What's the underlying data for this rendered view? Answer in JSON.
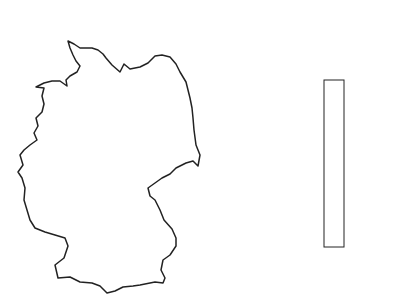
{
  "colors": {
    "outline": "#222222",
    "bands": [
      "#555555",
      "#5e5e5e",
      "#6a6a6a",
      "#7c7c7c",
      "#929292",
      "#b2b2b2",
      "#d2d2d2",
      "#ffffff"
    ]
  },
  "legend": {
    "ticks": [
      {
        "label": "15",
        "y": 200
      },
      {
        "label": "20",
        "y": 155
      },
      {
        "label": "25",
        "y": 108
      }
    ]
  },
  "points": [
    {
      "x": 59,
      "y": 67,
      "c": "#8a8a8a"
    },
    {
      "x": 97,
      "y": 70,
      "c": "#aaaaaa"
    },
    {
      "x": 106,
      "y": 69,
      "c": "#666666"
    },
    {
      "x": 93,
      "y": 82,
      "c": "#b8b8b8"
    },
    {
      "x": 95,
      "y": 88,
      "c": "#d0d0d0"
    },
    {
      "x": 119,
      "y": 78,
      "c": "#606060"
    },
    {
      "x": 143,
      "y": 78,
      "c": "#666666"
    },
    {
      "x": 128,
      "y": 95,
      "c": "#666666"
    },
    {
      "x": 124,
      "y": 106,
      "c": "#707070"
    },
    {
      "x": 116,
      "y": 110,
      "c": "#666666"
    },
    {
      "x": 75,
      "y": 109,
      "c": "#7a7a7a"
    },
    {
      "x": 162,
      "y": 100,
      "c": "#5a5a5a"
    },
    {
      "x": 174,
      "y": 106,
      "c": "#666666"
    },
    {
      "x": 156,
      "y": 115,
      "c": "#a8a8a8"
    },
    {
      "x": 167,
      "y": 116,
      "c": "#cccccc"
    },
    {
      "x": 164,
      "y": 121,
      "c": "#5a5a5a"
    },
    {
      "x": 174,
      "y": 123,
      "c": "#aaaaaa"
    },
    {
      "x": 182,
      "y": 117,
      "c": "#555555"
    },
    {
      "x": 186,
      "y": 132,
      "c": "#666666"
    },
    {
      "x": 38,
      "y": 142,
      "c": "#cccccc"
    },
    {
      "x": 80,
      "y": 142,
      "c": "#5a5a5a"
    },
    {
      "x": 93,
      "y": 145,
      "c": "#5a5a5a"
    },
    {
      "x": 64,
      "y": 151,
      "c": "#666666"
    },
    {
      "x": 80,
      "y": 155,
      "c": "#5a5a5a"
    },
    {
      "x": 107,
      "y": 157,
      "c": "#888888"
    },
    {
      "x": 113,
      "y": 158,
      "c": "#5a5a5a"
    },
    {
      "x": 160,
      "y": 152,
      "c": "#5a5a5a"
    },
    {
      "x": 162,
      "y": 159,
      "c": "#5a5a5a"
    },
    {
      "x": 175,
      "y": 165,
      "c": "#999999"
    },
    {
      "x": 65,
      "y": 172,
      "c": "#666666"
    },
    {
      "x": 60,
      "y": 177,
      "c": "#5a5a5a"
    },
    {
      "x": 135,
      "y": 176,
      "c": "#5a5a5a"
    },
    {
      "x": 117,
      "y": 182,
      "c": "#666666"
    },
    {
      "x": 109,
      "y": 184,
      "c": "#777777"
    },
    {
      "x": 100,
      "y": 185,
      "c": "#5a5a5a"
    },
    {
      "x": 81,
      "y": 189,
      "c": "#a2a2a2"
    },
    {
      "x": 136,
      "y": 191,
      "c": "#a0a0a0"
    },
    {
      "x": 143,
      "y": 191,
      "c": "#555555"
    },
    {
      "x": 154,
      "y": 187,
      "c": "#5e5e5e"
    },
    {
      "x": 170,
      "y": 177,
      "c": "#5a5a5a"
    },
    {
      "x": 175,
      "y": 180,
      "c": "#5a5a5a"
    },
    {
      "x": 196,
      "y": 174,
      "c": "#5a5a5a"
    },
    {
      "x": 26,
      "y": 181,
      "c": "#5a5a5a"
    },
    {
      "x": 28,
      "y": 193,
      "c": "#5a5a5a"
    },
    {
      "x": 41,
      "y": 210,
      "c": "#5a5a5a"
    },
    {
      "x": 45,
      "y": 212,
      "c": "#5a5a5a"
    },
    {
      "x": 40,
      "y": 215,
      "c": "#5a5a5a"
    },
    {
      "x": 47,
      "y": 220,
      "c": "#666666"
    },
    {
      "x": 72,
      "y": 207,
      "c": "#aaaaaa"
    },
    {
      "x": 73,
      "y": 213,
      "c": "#999999"
    },
    {
      "x": 78,
      "y": 213,
      "c": "#5a5a5a"
    },
    {
      "x": 77,
      "y": 220,
      "c": "#666666"
    },
    {
      "x": 58,
      "y": 225,
      "c": "#666666"
    },
    {
      "x": 90,
      "y": 225,
      "c": "#cccccc"
    },
    {
      "x": 93,
      "y": 237,
      "c": "#5a5a5a"
    },
    {
      "x": 166,
      "y": 239,
      "c": "#5a5a5a"
    },
    {
      "x": 86,
      "y": 254,
      "c": "#5a5a5a"
    },
    {
      "x": 59,
      "y": 268,
      "c": "#5a5a5a"
    },
    {
      "x": 57,
      "y": 272,
      "c": "#666666"
    },
    {
      "x": 124,
      "y": 268,
      "c": "#5a5a5a"
    }
  ]
}
